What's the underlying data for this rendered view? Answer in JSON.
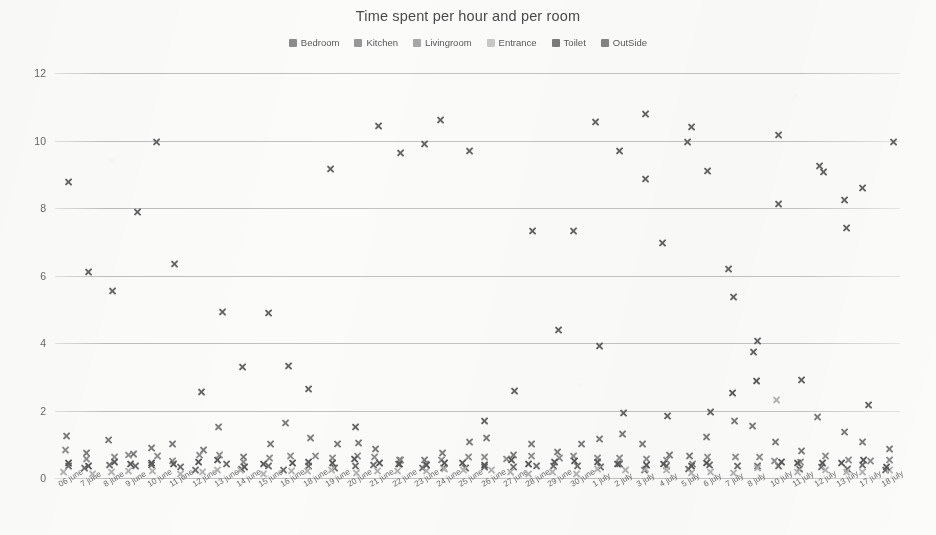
{
  "chart_data": {
    "type": "scatter",
    "title": "Time spent per hour and per room",
    "xlabel": "",
    "ylabel": "",
    "ylim": [
      0,
      12
    ],
    "yticks": [
      0,
      2,
      4,
      6,
      8,
      10,
      12
    ],
    "grid": true,
    "legend_position": "top-center",
    "marker": "x",
    "categories": [
      "06 june",
      "7 june",
      "8 june",
      "9 june",
      "10 june",
      "11 june",
      "12 june",
      "13 june",
      "14 june",
      "15 june",
      "16 june",
      "18 june",
      "19 june",
      "20 june",
      "21 june",
      "22 june",
      "23 june",
      "24 june",
      "25 june",
      "26 june",
      "27 june",
      "28 june",
      "29 june",
      "30 june",
      "1 july",
      "2 july",
      "3 july",
      "4 july",
      "5 july",
      "6 july",
      "7 july",
      "8 july",
      "10 july",
      "11 july",
      "12 july",
      "13 july",
      "17 july",
      "18 july"
    ],
    "series": [
      {
        "name": "Bedroom",
        "color": "#6e6e6e",
        "values": [
          0.35,
          0.3,
          0.45,
          0.28,
          0.4,
          0.35,
          0.3,
          0.42,
          0.25,
          0.38,
          0.3,
          0.33,
          0.28,
          0.35,
          0.3,
          0.38,
          0.26,
          0.3,
          0.35,
          0.28,
          0.34,
          0.3,
          0.38,
          0.32,
          0.3,
          0.36,
          0.28,
          0.34,
          0.3,
          0.38,
          0.3,
          0.42,
          0.34,
          0.3,
          0.38,
          0.28,
          0.36,
          0.3
        ]
      },
      {
        "name": "Kitchen",
        "color": "#7a7a7a",
        "values": [
          1.25,
          0.75,
          1.05,
          0.7,
          0.95,
          1.0,
          0.9,
          1.45,
          0.6,
          0.95,
          1.65,
          1.15,
          0.95,
          1.0,
          0.85,
          0.6,
          0.55,
          0.8,
          1.0,
          1.25,
          0.7,
          1.0,
          0.75,
          0.95,
          1.2,
          1.35,
          1.0,
          0.7,
          0.6,
          1.2,
          1.75,
          1.55,
          1.05,
          0.85,
          1.85,
          1.3,
          1.05,
          0.8
        ]
      },
      {
        "name": "Livingroom",
        "color": "#8d8d8d",
        "values": [
          0.75,
          0.55,
          0.6,
          0.68,
          0.7,
          0.55,
          0.62,
          0.7,
          0.5,
          0.58,
          0.65,
          0.6,
          0.55,
          0.66,
          0.58,
          0.52,
          0.48,
          0.55,
          0.62,
          0.58,
          0.55,
          0.6,
          0.52,
          0.58,
          0.62,
          0.55,
          0.5,
          0.52,
          0.48,
          0.6,
          0.58,
          0.62,
          0.55,
          0.48,
          0.6,
          0.55,
          0.58,
          0.52
        ]
      },
      {
        "name": "Entrance",
        "color": "#b2b2b2",
        "values": [
          0.2,
          0.18,
          0.22,
          0.25,
          0.2,
          0.18,
          0.24,
          0.2,
          0.22,
          0.18,
          0.2,
          0.24,
          0.18,
          0.2,
          0.22,
          0.18,
          0.2,
          0.24,
          0.18,
          0.22,
          0.2,
          0.18,
          0.24,
          0.2,
          0.22,
          0.18,
          0.2,
          0.24,
          0.18,
          0.22,
          0.2,
          0.24,
          2.35,
          0.2,
          0.22,
          0.18,
          0.2,
          0.24
        ]
      },
      {
        "name": "Toilet",
        "color": "#5a5a5a",
        "values": [
          0.45,
          0.4,
          0.48,
          0.42,
          0.5,
          0.45,
          0.4,
          0.52,
          0.38,
          0.44,
          0.48,
          0.42,
          0.4,
          0.5,
          0.45,
          0.4,
          0.38,
          0.44,
          0.5,
          0.42,
          0.46,
          0.4,
          0.48,
          0.44,
          0.42,
          0.5,
          0.38,
          0.46,
          0.4,
          0.48,
          2.55,
          2.85,
          0.45,
          0.4,
          0.48,
          0.42,
          0.46,
          0.4
        ]
      },
      {
        "name": "OutSide",
        "color": "#646464",
        "values": [
          8.75,
          6.05,
          5.5,
          7.8,
          9.95,
          6.4,
          2.55,
          4.85,
          3.35,
          4.95,
          3.35,
          2.65,
          9.1,
          1.45,
          10.4,
          9.7,
          9.9,
          10.6,
          9.7,
          1.65,
          2.55,
          7.25,
          4.45,
          7.3,
          10.6,
          1.95,
          10.75,
          1.85,
          9.95,
          1.95,
          6.25,
          3.8,
          8.15,
          2.85,
          9.05,
          8.25,
          2.15,
          9.9
        ]
      }
    ],
    "extra_outside_upper": [
      {
        "cat_index": 30,
        "value": 5.35
      },
      {
        "cat_index": 27,
        "value": 6.95
      },
      {
        "cat_index": 29,
        "value": 9.1
      },
      {
        "cat_index": 28,
        "value": 10.4
      },
      {
        "cat_index": 26,
        "value": 8.85
      },
      {
        "cat_index": 31,
        "value": 4.05
      },
      {
        "cat_index": 32,
        "value": 10.15
      },
      {
        "cat_index": 34,
        "value": 9.25
      },
      {
        "cat_index": 35,
        "value": 7.4
      },
      {
        "cat_index": 36,
        "value": 8.6
      },
      {
        "cat_index": 25,
        "value": 9.7
      },
      {
        "cat_index": 24,
        "value": 3.9
      }
    ]
  }
}
